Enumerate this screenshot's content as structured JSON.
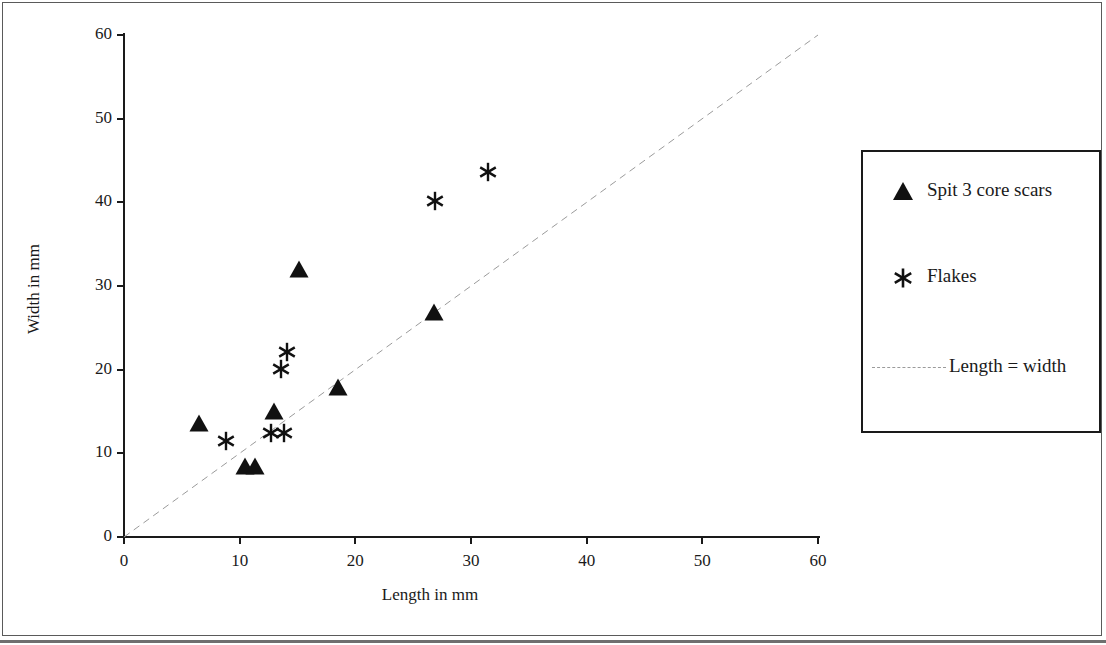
{
  "chart_data": {
    "type": "scatter",
    "title": "",
    "xlabel": "Length in mm",
    "ylabel": "Width in mm",
    "xlim": [
      0,
      60
    ],
    "ylim": [
      0,
      60
    ],
    "xticks": [
      0,
      10,
      20,
      30,
      40,
      50,
      60
    ],
    "yticks": [
      0,
      10,
      20,
      30,
      40,
      50,
      60
    ],
    "grid": false,
    "legend_position": "right",
    "series": [
      {
        "name": "Spit 3 core scars",
        "marker": "triangle",
        "color": "#111111",
        "points": [
          {
            "x": 6.5,
            "y": 13.6
          },
          {
            "x": 10.5,
            "y": 8.5
          },
          {
            "x": 11.3,
            "y": 8.5
          },
          {
            "x": 13.0,
            "y": 15.1
          },
          {
            "x": 15.1,
            "y": 32.0
          },
          {
            "x": 18.5,
            "y": 17.9
          },
          {
            "x": 26.8,
            "y": 26.9
          }
        ]
      },
      {
        "name": "Flakes",
        "marker": "asterisk",
        "color": "#111111",
        "points": [
          {
            "x": 8.8,
            "y": 11.5
          },
          {
            "x": 12.7,
            "y": 12.4
          },
          {
            "x": 13.8,
            "y": 12.4
          },
          {
            "x": 13.6,
            "y": 20.1
          },
          {
            "x": 14.1,
            "y": 22.1
          },
          {
            "x": 26.9,
            "y": 40.1
          },
          {
            "x": 31.5,
            "y": 43.6
          }
        ]
      }
    ],
    "reference_line": {
      "name": "Length = width",
      "style": "dashed",
      "color": "#9b9b9b",
      "from": {
        "x": 0,
        "y": 0
      },
      "to": {
        "x": 60,
        "y": 60
      }
    }
  },
  "axes": {
    "x_title": "Length in mm",
    "y_title": "Width in mm",
    "x_tick_labels": [
      "0",
      "10",
      "20",
      "30",
      "40",
      "50",
      "60"
    ],
    "y_tick_labels": [
      "0",
      "10",
      "20",
      "30",
      "40",
      "50",
      "60"
    ]
  },
  "legend": {
    "entries": [
      {
        "label": "Spit 3 core scars",
        "symbol": "triangle-icon"
      },
      {
        "label": "Flakes",
        "symbol": "asterisk-icon"
      },
      {
        "label": "Length = width",
        "symbol": "dashed-line-icon"
      }
    ]
  }
}
